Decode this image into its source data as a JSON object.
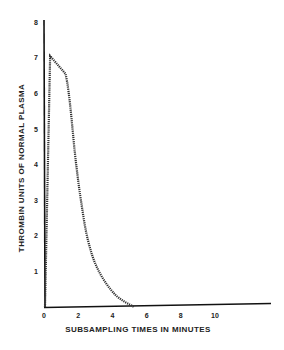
{
  "chart_data": {
    "type": "line",
    "title": "",
    "xlabel": "SUBSAMPLING TIMES IN MINUTES",
    "ylabel": "THROMBIN UNITS OF NORMAL PLASMA",
    "xlim": [
      0,
      13
    ],
    "ylim": [
      0,
      8
    ],
    "x_ticks": [
      0,
      2,
      4,
      6,
      8,
      10
    ],
    "x_tick_labels": [
      "0",
      "2",
      "4",
      "6",
      "8",
      "10"
    ],
    "y_ticks": [
      1,
      2,
      3,
      4,
      5,
      6,
      7,
      8
    ],
    "y_tick_labels": [
      "1",
      "2",
      "3",
      "4",
      "5",
      "6",
      "7",
      "8"
    ],
    "grid": false,
    "legend": null,
    "series": [
      {
        "name": "Thrombin generation",
        "style": "hatched dotted line",
        "x": [
          0,
          0.3,
          1.2,
          1.8,
          2.1,
          2.5,
          3.1,
          4.1,
          5.2
        ],
        "y": [
          0,
          7.05,
          6.55,
          4.1,
          3.0,
          1.9,
          1.05,
          0.35,
          0
        ]
      }
    ]
  }
}
